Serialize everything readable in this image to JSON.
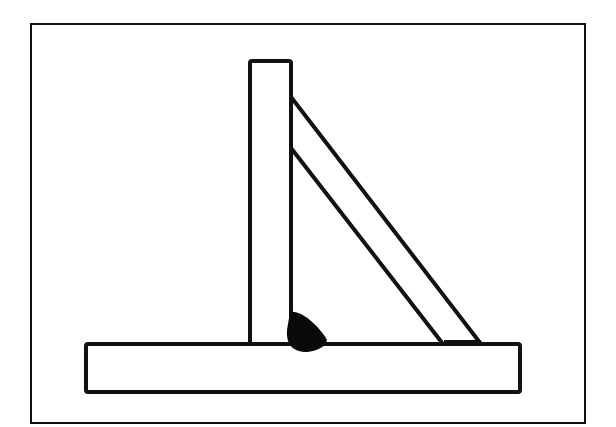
{
  "diagram": {
    "colors": {
      "line": "#111111",
      "background": "#ffffff",
      "weld": "#0a0a0a"
    },
    "frame": {
      "x": 31,
      "y": 24,
      "w": 554,
      "h": 399
    },
    "base_plate": {
      "x": 86,
      "y": 344,
      "w": 434,
      "h": 48
    },
    "vertical_member": {
      "x": 250,
      "y": 61,
      "w": 41,
      "h": 283
    },
    "brace": {
      "points": "291,97 481,344 443,344 291,148"
    },
    "weld_bead": {
      "label": "fillet-weld"
    }
  }
}
